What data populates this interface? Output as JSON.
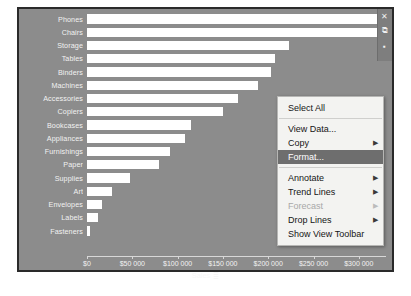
{
  "chart_panel": {
    "background_color": "#8c8c8c",
    "bar_color": "#ffffff"
  },
  "side_controls": [
    {
      "name": "close-icon",
      "glyph": "✕"
    },
    {
      "name": "popout-icon",
      "glyph": "⧉"
    },
    {
      "name": "more-options-icon",
      "glyph": "▪"
    }
  ],
  "axis": {
    "title": "Sales",
    "sort_icon": "≣",
    "tick_labels": [
      "$0",
      "$50 000",
      "$100 000",
      "$150 000",
      "$200 000",
      "$250 000",
      "$300 000"
    ]
  },
  "context_menu": {
    "items": [
      {
        "label": "Select All",
        "submenu": false,
        "disabled": false,
        "selected": false,
        "separator_after": true
      },
      {
        "label": "View Data...",
        "submenu": false,
        "disabled": false,
        "selected": false,
        "separator_after": false
      },
      {
        "label": "Copy",
        "submenu": true,
        "disabled": false,
        "selected": false,
        "separator_after": false
      },
      {
        "label": "Format...",
        "submenu": false,
        "disabled": false,
        "selected": true,
        "separator_after": true
      },
      {
        "label": "Annotate",
        "submenu": true,
        "disabled": false,
        "selected": false,
        "separator_after": false
      },
      {
        "label": "Trend Lines",
        "submenu": true,
        "disabled": false,
        "selected": false,
        "separator_after": false
      },
      {
        "label": "Forecast",
        "submenu": true,
        "disabled": true,
        "selected": false,
        "separator_after": false
      },
      {
        "label": "Drop Lines",
        "submenu": true,
        "disabled": false,
        "selected": false,
        "separator_after": false
      },
      {
        "label": "Show View Toolbar",
        "submenu": false,
        "disabled": false,
        "selected": false,
        "separator_after": false
      }
    ],
    "submenu_arrow": "▶"
  },
  "chart_data": {
    "type": "bar",
    "orientation": "horizontal",
    "title": "",
    "xlabel": "Sales",
    "ylabel": "",
    "xlim": [
      0,
      330000
    ],
    "grid": false,
    "legend": false,
    "categories": [
      "Phones",
      "Chairs",
      "Storage",
      "Tables",
      "Binders",
      "Machines",
      "Accessories",
      "Copiers",
      "Bookcases",
      "Appliances",
      "Furnishings",
      "Paper",
      "Supplies",
      "Art",
      "Envelopes",
      "Labels",
      "Fasteners"
    ],
    "values": [
      330000,
      328000,
      223000,
      207000,
      203000,
      189000,
      167000,
      150000,
      115000,
      108000,
      92000,
      79000,
      47000,
      28000,
      17000,
      12000,
      3000
    ]
  }
}
